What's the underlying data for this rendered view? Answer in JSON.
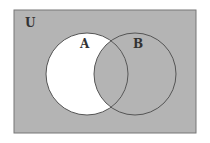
{
  "diagram": {
    "type": "venn",
    "universe_label": "U",
    "sets": [
      {
        "label": "A",
        "cx": 87,
        "cy": 74,
        "r": 41
      },
      {
        "label": "B",
        "cx": 135,
        "cy": 74,
        "r": 41
      }
    ],
    "shaded_region": "complement of (A minus B)",
    "unshaded_region": "A minus B",
    "colors": {
      "background": "#ffffff",
      "shading": "#b4b4b4",
      "unshaded": "#ffffff",
      "outline": "#555555"
    }
  }
}
